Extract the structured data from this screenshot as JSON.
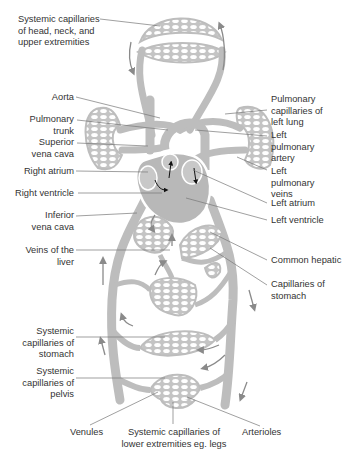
{
  "colors": {
    "vessel": "#bdbdbd",
    "capillary_mesh": "#c4c4c4",
    "heart_fill": "#b8b8b8",
    "leader_line": "#777777",
    "text": "#333333",
    "arrow": "#8a8a8a",
    "heart_arrow": "#111111",
    "background": "#ffffff"
  },
  "labels": {
    "head_caps": "Systemic capillaries\nof head, neck, and\nupper extremities",
    "aorta": "Aorta",
    "pulm_trunk": "Pulmonary\ntrunk",
    "svc": "Superior\nvena cava",
    "right_atrium": "Right atrium",
    "right_ventricle": "Right ventricle",
    "ivc": "Inferior\nvena cava",
    "liver_veins": "Veins of the\nliver",
    "sys_caps_stomach": "Systemic\ncapillaries of\nstomach",
    "sys_caps_pelvis": "Systemic\ncapillaries of\npelvis",
    "venules": "Venules",
    "lower_caps": "Systemic capillaries of\nlower extremities eg. legs",
    "arterioles": "Arterioles",
    "pulm_caps_left": "Pulmonary\ncapillaries of\nleft lung",
    "left_pulm_artery": "Left\npulmonary\nartery",
    "left_pulm_veins": "Left\npulmonary\nveins",
    "left_atrium": "Left atrium",
    "left_ventricle": "Left ventricle",
    "common_hepatic": "Common hepatic",
    "caps_stomach": "Capillaries of\nstomach"
  }
}
